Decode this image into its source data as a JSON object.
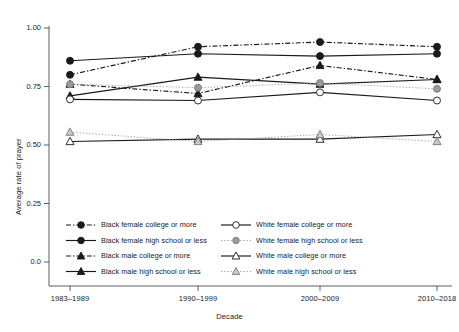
{
  "chart_data": {
    "type": "line",
    "title": "",
    "xlabel": "Decade",
    "ylabel": "Average rate of prayer",
    "categories": [
      "1983–1989",
      "1990–1999",
      "2000–2009",
      "2010–2018"
    ],
    "ytick_labels": [
      "0.0",
      "0.25",
      "0.50",
      "0.75",
      "1.00"
    ],
    "ytick_values": [
      0.0,
      0.25,
      0.5,
      0.75,
      1.0
    ],
    "ylim": [
      0.0,
      1.02
    ],
    "grid": false,
    "legend_position": "bottom",
    "series": [
      {
        "name": "Black female college or more",
        "values": [
          0.8,
          0.92,
          0.94,
          0.92
        ],
        "marker": "filled-circle",
        "marker_fill": "#1a1a1a",
        "line_style": "dash-dot",
        "line_color": "#1a1a1a"
      },
      {
        "name": "Black female high school or less",
        "values": [
          0.86,
          0.89,
          0.88,
          0.89
        ],
        "marker": "filled-circle",
        "marker_fill": "#1a1a1a",
        "line_style": "solid",
        "line_color": "#1a1a1a"
      },
      {
        "name": "Black male college or more",
        "values": [
          0.76,
          0.72,
          0.84,
          0.78
        ],
        "marker": "filled-triangle",
        "marker_fill": "#1a1a1a",
        "line_style": "dash-dot",
        "line_color": "#1a1a1a"
      },
      {
        "name": "Black male high school or less",
        "values": [
          0.71,
          0.79,
          0.76,
          0.78
        ],
        "marker": "filled-triangle",
        "marker_fill": "#1a1a1a",
        "line_style": "solid",
        "line_color": "#1a1a1a"
      },
      {
        "name": "White female college or more",
        "values": [
          0.695,
          0.69,
          0.725,
          0.69
        ],
        "marker": "open-circle",
        "marker_fill": "#ffffff",
        "line_style": "solid",
        "line_color": "#1a1a1a"
      },
      {
        "name": "White female high school or less",
        "values": [
          0.76,
          0.745,
          0.765,
          0.74
        ],
        "marker": "open-circle",
        "marker_fill": "#9a9a9a",
        "line_style": "dotted",
        "line_color": "#9a9a9a"
      },
      {
        "name": "White male college or more",
        "values": [
          0.515,
          0.525,
          0.525,
          0.545
        ],
        "marker": "open-triangle",
        "marker_fill": "#ffffff",
        "line_style": "solid",
        "line_color": "#1a1a1a"
      },
      {
        "name": "White male high school or less",
        "values": [
          0.555,
          0.515,
          0.545,
          0.515
        ],
        "marker": "open-triangle",
        "marker_fill": "#c8c8c8",
        "line_style": "dotted",
        "line_color": "#9a9a9a"
      }
    ],
    "legend": [
      {
        "label": "Black female college or more",
        "col": 0,
        "row": 0
      },
      {
        "label": "Black female high school or less",
        "col": 0,
        "row": 1
      },
      {
        "label": "Black male college or more",
        "col": 0,
        "row": 2
      },
      {
        "label": "Black male high school or less",
        "col": 0,
        "row": 3
      },
      {
        "label": "White female college or more",
        "col": 1,
        "row": 0
      },
      {
        "label": "White female high school or less",
        "col": 1,
        "row": 1
      },
      {
        "label": "White male college or more",
        "col": 1,
        "row": 2
      },
      {
        "label": "White male high school or less",
        "col": 1,
        "row": 3
      }
    ]
  },
  "colors": {
    "axis": "#4d4d4d",
    "black_series": "#1a1a1a",
    "white_series_gray": "#9a9a9a",
    "background": "#ffffff"
  }
}
